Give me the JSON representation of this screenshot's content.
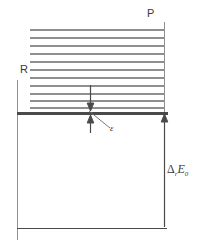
{
  "figure": {
    "type": "energy-level-diagram",
    "background_color": "#ffffff",
    "line_color_thin": "#8c8c8c",
    "line_color_thick": "#4a4a4a",
    "labels": {
      "reactant_axis": "R",
      "product_axis": "P",
      "level_spacing": "ε",
      "reaction_energy_delta": "Δ",
      "reaction_energy_sub1": "r",
      "reaction_energy_main": "E",
      "reaction_energy_sub2": "0"
    },
    "levels": {
      "count": 11,
      "top_y": 30,
      "bottom_y": 108,
      "x_start": 30,
      "x_end": 164
    },
    "baseline": {
      "y": 113,
      "x_start": 17,
      "x_end": 168
    },
    "ground_line": {
      "y": 228,
      "x_start": 17,
      "x_end": 167
    },
    "arrows": {
      "epsilon_down": {
        "x": 90,
        "y_from": 85,
        "y_to": 108
      },
      "epsilon_up": {
        "x": 90,
        "y_from": 133,
        "y_to": 116
      },
      "delta_up": {
        "x": 164,
        "y_from": 226,
        "y_to": 116
      }
    },
    "leader_line": {
      "x1": 90,
      "y1": 110,
      "x2": 111,
      "y2": 128
    }
  }
}
